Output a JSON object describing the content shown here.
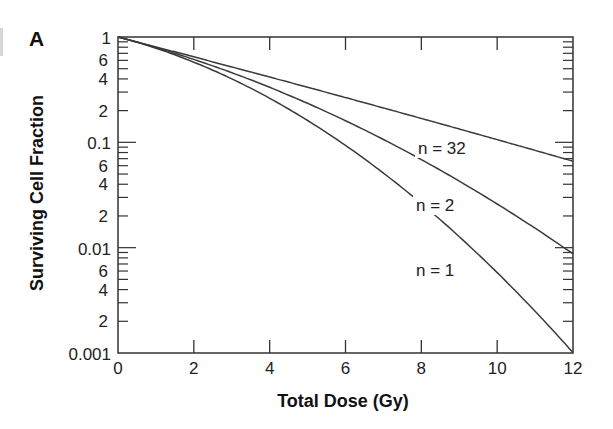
{
  "chart_data": {
    "type": "line",
    "panel_label": "A",
    "title": "",
    "xlabel": "Total Dose (Gy)",
    "ylabel": "Surviving Cell Fraction",
    "xlim": [
      0,
      12
    ],
    "ylim": [
      0.001,
      1
    ],
    "yscale": "log",
    "xticks": [
      0,
      2,
      4,
      6,
      8,
      10,
      12
    ],
    "xtick_labels": [
      "0",
      "2",
      "4",
      "6",
      "8",
      "10",
      "12"
    ],
    "ytick_major": [
      1,
      0.1,
      0.01,
      0.001
    ],
    "ytick_major_labels": [
      "1",
      "0.1",
      "0.01",
      "0.001"
    ],
    "ytick_minor_labels": [
      "6",
      "4",
      "2"
    ],
    "grid": false,
    "model": {
      "alpha": 0.215,
      "beta": 0.03,
      "formula": "S = exp(-n(alpha*d + beta*d^2)), d = D/n"
    },
    "series": [
      {
        "name": "n = 32",
        "x": [
          0,
          2,
          4,
          6,
          8,
          10,
          12
        ],
        "values": [
          1,
          0.645,
          0.417,
          0.269,
          0.174,
          0.112,
          0.066
        ],
        "label_pos": [
          418,
          154
        ]
      },
      {
        "name": "n = 2",
        "x": [
          0,
          2,
          4,
          6,
          8,
          10,
          12
        ],
        "values": [
          1,
          0.613,
          0.345,
          0.178,
          0.0836,
          0.0357,
          0.0087
        ],
        "label_pos": [
          416,
          211
        ]
      },
      {
        "name": "n = 1",
        "x": [
          0,
          2,
          4,
          6,
          8,
          10,
          12
        ],
        "values": [
          1,
          0.578,
          0.263,
          0.0944,
          0.0264,
          0.0058,
          0.001
        ],
        "label_pos": [
          416,
          276
        ]
      }
    ]
  },
  "colors": {
    "line": "#3a3a3a",
    "axis": "#333333",
    "text": "#222222"
  }
}
